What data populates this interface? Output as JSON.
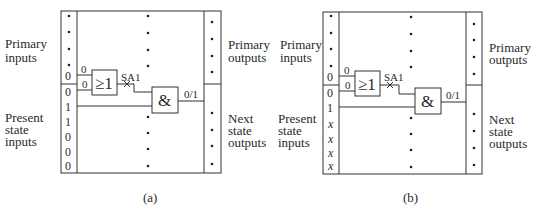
{
  "figure": {
    "panels": [
      {
        "id": "a",
        "caption": "(a)",
        "labels": {
          "primary_inputs": [
            "Primary",
            "inputs"
          ],
          "primary_outputs": [
            "Primary",
            "outputs"
          ],
          "present_state_inputs": [
            "Present",
            "state",
            "inputs"
          ],
          "next_state_outputs": [
            "Next",
            "state",
            "outputs"
          ]
        },
        "primary_input_values": [
          "0"
        ],
        "present_state_values": [
          "0",
          "1",
          "1",
          "0",
          "0",
          "0"
        ],
        "or_gate": {
          "symbol": "≥1",
          "input_values": [
            "0",
            "0"
          ]
        },
        "fault_label": "SA1",
        "and_gate": {
          "symbol": "&",
          "output_value": "0/1"
        }
      },
      {
        "id": "b",
        "caption": "(b)",
        "labels": {
          "primary_inputs": [
            "Primary",
            "inputs"
          ],
          "primary_outputs": [
            "Primary",
            "outputs"
          ],
          "present_state_inputs": [
            "Present",
            "state",
            "inputs"
          ],
          "next_state_outputs": [
            "Next",
            "state",
            "outputs"
          ]
        },
        "primary_input_values": [
          "0"
        ],
        "present_state_values": [
          "0",
          "1",
          "x",
          "x",
          "x",
          "x"
        ],
        "or_gate": {
          "symbol": "≥1",
          "input_values": [
            "0",
            "0"
          ]
        },
        "fault_label": "SA1",
        "and_gate": {
          "symbol": "&",
          "output_value": "0/1"
        }
      }
    ]
  }
}
